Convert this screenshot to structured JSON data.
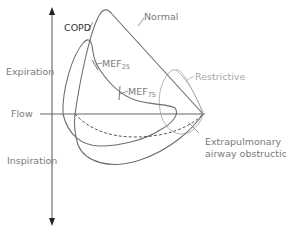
{
  "diagram": {
    "axis": {
      "y_label": "Flow",
      "upper_label": "Expiration",
      "lower_label": "Inspiration"
    },
    "curves": [
      {
        "name": "Normal",
        "label": "Normal",
        "color": "#6e6e6e"
      },
      {
        "name": "COPD",
        "label": "COPD",
        "color": "#6e6e6e"
      },
      {
        "name": "Restrictive",
        "label": "Restrictive",
        "color": "#b0b0b0"
      },
      {
        "name": "Extrapulmonary airway obstruction",
        "label_line1": "Extrapulmonary",
        "label_line2": "airway obstruction",
        "color": "#555555",
        "style": "dashed"
      }
    ],
    "markers": [
      {
        "label": "MEF",
        "subscript": "25"
      },
      {
        "label": "MEF",
        "subscript": "75"
      }
    ]
  }
}
